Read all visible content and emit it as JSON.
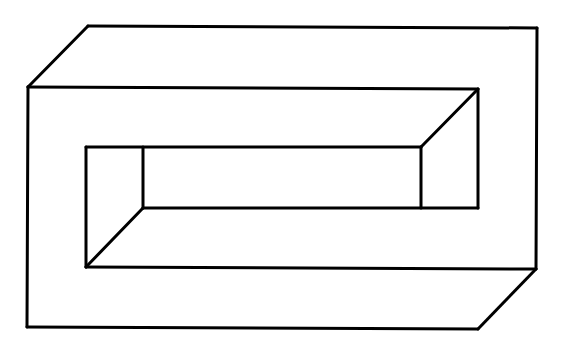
{
  "figure": {
    "title": "",
    "width": 564,
    "height": 356,
    "background": "#ffffff",
    "stroke_color": "#000000",
    "stroke_width": 3,
    "lines": [
      {
        "name": "outer-front-top-edge",
        "x1": 28,
        "y1": 87,
        "x2": 478,
        "y2": 89
      },
      {
        "name": "outer-front-left-edge",
        "x1": 28,
        "y1": 87,
        "x2": 27,
        "y2": 327
      },
      {
        "name": "outer-front-bottom-edge",
        "x1": 27,
        "y1": 327,
        "x2": 478,
        "y2": 329
      },
      {
        "name": "outer-top-left-diagonal",
        "x1": 28,
        "y1": 87,
        "x2": 88,
        "y2": 26
      },
      {
        "name": "outer-back-top-edge",
        "x1": 88,
        "y1": 26,
        "x2": 537,
        "y2": 28
      },
      {
        "name": "outer-back-right-edge",
        "x1": 537,
        "y1": 28,
        "x2": 536,
        "y2": 269
      },
      {
        "name": "outer-bottom-right-diagonal",
        "x1": 536,
        "y1": 269,
        "x2": 478,
        "y2": 329
      },
      {
        "name": "inner-back-top-edge",
        "x1": 86,
        "y1": 147,
        "x2": 421,
        "y2": 147
      },
      {
        "name": "inner-front-top-edge",
        "x1": 86,
        "y1": 147,
        "x2": 86,
        "y2": 147
      },
      {
        "name": "inner-front-left-edge",
        "x1": 86,
        "y1": 147,
        "x2": 86,
        "y2": 267
      },
      {
        "name": "inner-front-bottom-edge",
        "x1": 86,
        "y1": 267,
        "x2": 536,
        "y2": 269
      },
      {
        "name": "inner-back-left-vertical",
        "x1": 143,
        "y1": 147,
        "x2": 143,
        "y2": 208
      },
      {
        "name": "inner-bottom-left-diagonal",
        "x1": 143,
        "y1": 208,
        "x2": 86,
        "y2": 267
      },
      {
        "name": "inner-back-bottom-edge",
        "x1": 143,
        "y1": 208,
        "x2": 478,
        "y2": 208
      },
      {
        "name": "inner-top-edge-upper",
        "x1": 28,
        "y1": 87,
        "x2": 28,
        "y2": 87
      },
      {
        "name": "inner-upper-top-edge",
        "x1": 86,
        "y1": 147,
        "x2": 86,
        "y2": 147
      },
      {
        "name": "inner-right-upper-edge",
        "x1": 478,
        "y1": 89,
        "x2": 478,
        "y2": 208
      },
      {
        "name": "inner-top-right-diagonal",
        "x1": 478,
        "y1": 89,
        "x2": 421,
        "y2": 147
      },
      {
        "name": "inner-back-right-vertical",
        "x1": 421,
        "y1": 147,
        "x2": 421,
        "y2": 208
      }
    ]
  }
}
